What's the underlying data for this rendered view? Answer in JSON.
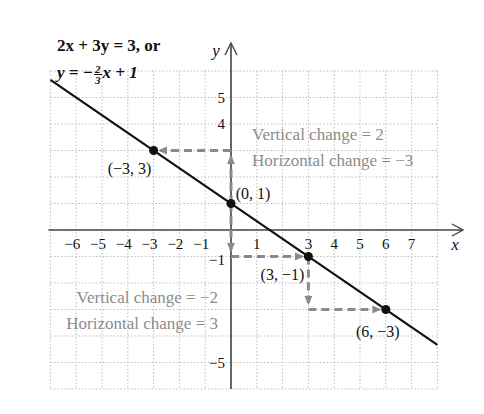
{
  "equation": {
    "line1": "2x + 3y = 3, or",
    "line2_prefix": "y = −",
    "frac_num": "2",
    "frac_den": "3",
    "line2_suffix": "x + 1"
  },
  "axes": {
    "x_label": "x",
    "y_label": "y",
    "x_ticks": [
      "−6",
      "−5",
      "−4",
      "−3",
      "−2",
      "−1",
      "1",
      "3",
      "4",
      "5",
      "6",
      "7"
    ],
    "y_ticks": [
      "5",
      "4",
      "−1",
      "−5"
    ]
  },
  "points": [
    {
      "label": "(−3, 3)",
      "x": -3,
      "y": 3
    },
    {
      "label": "(0, 1)",
      "x": 0,
      "y": 1
    },
    {
      "label": "(3, −1)",
      "x": 3,
      "y": -1
    },
    {
      "label": "(6, −3)",
      "x": 6,
      "y": -3
    }
  ],
  "annotations": {
    "upper_vertical": "Vertical change = 2",
    "upper_horizontal": "Horizontal change = −3",
    "lower_vertical": "Vertical change = −2",
    "lower_horizontal": "Horizontal change = 3"
  },
  "colors": {
    "line": "#111111",
    "dashed_arrow": "#8a8a8a",
    "annotation_text": "#8c8c8c",
    "grid": "#bdbdbd",
    "axis": "#444444"
  },
  "chart_data": {
    "type": "line",
    "xlabel": "x",
    "ylabel": "y",
    "xlim": [
      -7,
      8
    ],
    "ylim": [
      -6,
      6
    ],
    "grid": true,
    "series": [
      {
        "name": "y = -2/3 x + 1",
        "x": [
          -7,
          8
        ],
        "y": [
          5.667,
          -4.333
        ]
      }
    ],
    "marked_points": [
      [
        -3,
        3
      ],
      [
        0,
        1
      ],
      [
        3,
        -1
      ],
      [
        6,
        -3
      ]
    ]
  }
}
